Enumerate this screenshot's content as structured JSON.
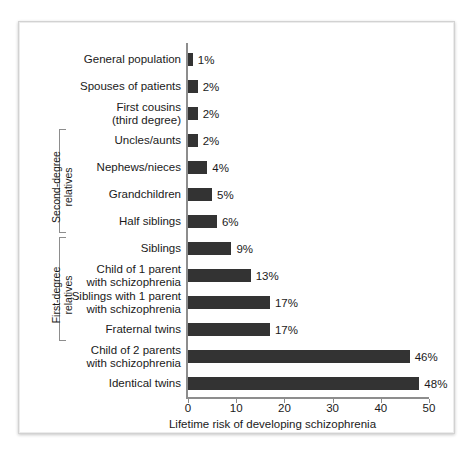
{
  "chart_data": {
    "type": "bar",
    "orientation": "horizontal",
    "title": "",
    "xlabel": "Lifetime risk of developing schizophrenia",
    "ylabel": "",
    "xlim": [
      0,
      50
    ],
    "xticks": [
      0,
      10,
      20,
      30,
      40,
      50
    ],
    "xtick_labels": [
      "0",
      "10",
      "20",
      "30",
      "40",
      "50"
    ],
    "grid": false,
    "legend": null,
    "bar_color": "#333333",
    "axis_color": "#8d8d8d",
    "value_suffix": "%",
    "categories": [
      "General population",
      "Spouses of patients",
      "First cousins\n(third degree)",
      "Uncles/aunts",
      "Nephews/nieces",
      "Grandchildren",
      "Half siblings",
      "Siblings",
      "Child of 1 parent\nwith schizophrenia",
      "Siblings with 1 parent\nwith schizophrenia",
      "Fraternal twins",
      "Child of 2 parents\nwith schizophrenia",
      "Identical twins"
    ],
    "values": [
      1,
      2,
      2,
      2,
      4,
      5,
      6,
      9,
      13,
      17,
      17,
      46,
      48
    ],
    "value_labels": [
      "1%",
      "2%",
      "2%",
      "2%",
      "4%",
      "5%",
      "6%",
      "9%",
      "13%",
      "17%",
      "17%",
      "46%",
      "48%"
    ],
    "groups": [
      {
        "label": "Second-degree\nrelatives",
        "first_index": 3,
        "last_index": 6
      },
      {
        "label": "First-degree\nrelatives",
        "first_index": 7,
        "last_index": 10
      }
    ]
  }
}
